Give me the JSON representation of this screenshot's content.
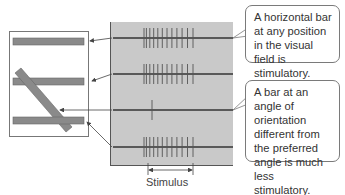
{
  "colors": {
    "panel_fill": "#c9c9c9",
    "bar_fill": "#8a8a8a",
    "trace": "#333333",
    "spike": "#555555"
  },
  "receptive_field": {
    "stimuli": [
      {
        "orientation": "horizontal",
        "position": "top",
        "response_row": 1
      },
      {
        "orientation": "horizontal",
        "position": "middle",
        "response_row": 2
      },
      {
        "orientation": "diagonal",
        "position": "center",
        "response_row": 3
      },
      {
        "orientation": "horizontal",
        "position": "bottom",
        "response_row": 4
      }
    ]
  },
  "recordings": [
    {
      "spike_count": 12
    },
    {
      "spike_count": 12
    },
    {
      "spike_count": 1
    },
    {
      "spike_count": 12
    }
  ],
  "stimulus_label": "Stimulus",
  "callouts": [
    {
      "text": "A horizontal bar at any position in the visual field is stimulatory."
    },
    {
      "text": "A bar at an angle of orientation different from the preferred angle is much less stimulatory."
    }
  ]
}
